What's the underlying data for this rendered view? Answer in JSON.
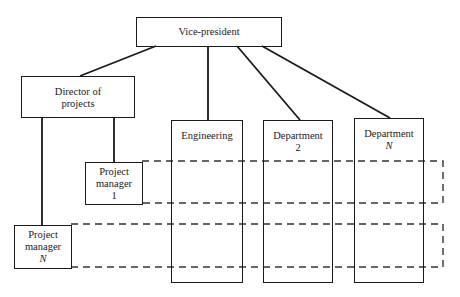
{
  "diagram": {
    "type": "organizational-chart",
    "nodes": {
      "vice_president": {
        "label": "Vice-president"
      },
      "director": {
        "line1": "Director of",
        "line2": "projects"
      },
      "engineering": {
        "label": "Engineering"
      },
      "department_2": {
        "line1": "Department",
        "line2": "2"
      },
      "department_n": {
        "line1": "Department",
        "line2": "N"
      },
      "pm_1": {
        "line1": "Project",
        "line2": "manager",
        "line3": "1"
      },
      "pm_n": {
        "line1": "Project",
        "line2": "manager",
        "line3": "N"
      }
    },
    "edges": [
      {
        "from": "Vice-president",
        "to": "Director of projects",
        "style": "solid"
      },
      {
        "from": "Vice-president",
        "to": "Engineering",
        "style": "solid"
      },
      {
        "from": "Vice-president",
        "to": "Department 2",
        "style": "solid"
      },
      {
        "from": "Vice-president",
        "to": "Department N",
        "style": "solid"
      },
      {
        "from": "Director of projects",
        "to": "Project manager 1",
        "style": "solid"
      },
      {
        "from": "Director of projects",
        "to": "Project manager N",
        "style": "solid"
      },
      {
        "from": "Project manager 1",
        "to": "Engineering, Department 2, Department N",
        "style": "dashed-band"
      },
      {
        "from": "Project manager N",
        "to": "Engineering, Department 2, Department N",
        "style": "dashed-band"
      }
    ]
  }
}
